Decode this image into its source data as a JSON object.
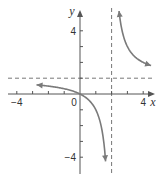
{
  "chart_data": {
    "type": "line",
    "title": "",
    "function": "f(x) = x/(x-2)",
    "xlabel": "x",
    "ylabel": "y",
    "xlim": [
      -4.5,
      4.7
    ],
    "ylim": [
      -5.0,
      5.3
    ],
    "x_ticks": [
      -4,
      -3,
      -2,
      -1,
      0,
      1,
      2,
      3,
      4
    ],
    "y_ticks": [
      -4,
      -3,
      -2,
      -1,
      1,
      2,
      3,
      4
    ],
    "x_tick_labels": [
      {
        "value": -4,
        "text": "−4"
      },
      {
        "value": 0,
        "text": "0"
      },
      {
        "value": 4,
        "text": "4"
      }
    ],
    "y_tick_labels": [
      {
        "value": 4,
        "text": "4"
      },
      {
        "value": -4,
        "text": "−4"
      }
    ],
    "asymptotes": [
      {
        "orientation": "vertical",
        "value": 2,
        "style": "dashed"
      },
      {
        "orientation": "horizontal",
        "value": 1,
        "style": "dashed"
      }
    ],
    "series": [
      {
        "name": "left-branch",
        "x_range": [
          -2.75,
          1.62
        ],
        "arrows": "both"
      },
      {
        "name": "right-branch",
        "x_range": [
          2.47,
          4.5
        ],
        "arrows": "both"
      }
    ],
    "grid": false,
    "colors": {
      "curve": "#7a7a7a",
      "axis": "#555555",
      "asymptote": "#777777"
    }
  }
}
